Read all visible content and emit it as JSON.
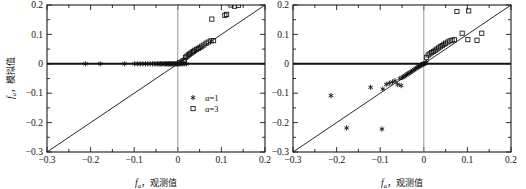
{
  "figure": {
    "panel_count": 2,
    "axis_x_title_sym": "f",
    "axis_x_title_subscript": "a",
    "axis_x_title_cjk": "，观测值",
    "axis_y_title_sym": "f",
    "axis_y_title_subscript": "a",
    "axis_y_title_cjk": "，模拟值",
    "tick_labels_x": [
      "-0.3",
      "-0.2",
      "-0.1",
      "0",
      "0.1",
      "0.2"
    ],
    "tick_labels_y": [
      "-0.3",
      "-0.2",
      "-0.1",
      "0",
      "0.1",
      "0.2"
    ],
    "legend": {
      "entries": [
        {
          "label": "α=1",
          "marker": "asterisk-marker"
        },
        {
          "label": "α=3",
          "marker": "open-square-marker"
        }
      ]
    },
    "colors": {
      "ink": "#111111",
      "frame": "#1a1a1a",
      "zero_line": "#111111",
      "vertical_zero": "#8a8a8a",
      "background": "#ffffff"
    }
  },
  "chart_data": [
    {
      "type": "scatter",
      "panel": "left",
      "title": "",
      "xlabel": "f_a，观测值",
      "ylabel": "f_a，模拟值",
      "xlim": [
        -0.3,
        0.2
      ],
      "ylim": [
        -0.3,
        0.2
      ],
      "xticks": [
        -0.3,
        -0.2,
        -0.1,
        0,
        0.1,
        0.2
      ],
      "yticks": [
        -0.3,
        -0.2,
        -0.1,
        0,
        0.1,
        0.2
      ],
      "grid": false,
      "legend_position": "lower-right-inside",
      "reference_lines": [
        {
          "name": "one-to-one-line",
          "type": "diagonal",
          "from": [
            -0.3,
            -0.3
          ],
          "to": [
            0.2,
            0.2
          ]
        },
        {
          "name": "horizontal-zero-line",
          "type": "horizontal",
          "y": 0
        },
        {
          "name": "vertical-zero-line",
          "type": "vertical",
          "x": 0
        }
      ],
      "series": [
        {
          "name": "α=1",
          "marker": "asterisk",
          "points": [
            [
              -0.212,
              0.0
            ],
            [
              -0.178,
              0.0
            ],
            [
              -0.122,
              0.0
            ],
            [
              -0.099,
              0.0
            ],
            [
              -0.092,
              0.0
            ],
            [
              -0.086,
              0.0
            ],
            [
              -0.08,
              0.0
            ],
            [
              -0.074,
              0.0
            ],
            [
              -0.069,
              0.0
            ],
            [
              -0.063,
              0.0
            ],
            [
              -0.058,
              0.0
            ],
            [
              -0.054,
              0.0
            ],
            [
              -0.05,
              0.0
            ],
            [
              -0.046,
              0.0
            ],
            [
              -0.043,
              0.0
            ],
            [
              -0.04,
              0.0
            ],
            [
              -0.037,
              0.0
            ],
            [
              -0.034,
              0.0
            ],
            [
              -0.031,
              0.0
            ],
            [
              -0.028,
              0.0
            ],
            [
              -0.026,
              0.0
            ],
            [
              -0.023,
              0.0
            ],
            [
              -0.021,
              0.0
            ],
            [
              -0.019,
              0.0
            ],
            [
              -0.017,
              0.0
            ],
            [
              -0.015,
              0.0
            ],
            [
              -0.013,
              0.0
            ],
            [
              -0.011,
              0.0
            ],
            [
              -0.009,
              0.0
            ],
            [
              -0.007,
              0.0
            ],
            [
              -0.005,
              0.0
            ],
            [
              -0.003,
              0.0
            ],
            [
              -0.001,
              0.0
            ],
            [
              0.001,
              0.0
            ],
            [
              0.003,
              0.0
            ],
            [
              0.006,
              0.0
            ],
            [
              0.009,
              0.0
            ],
            [
              0.012,
              0.0
            ],
            [
              0.016,
              0.0
            ],
            [
              0.02,
              0.0
            ]
          ]
        },
        {
          "name": "α=3",
          "marker": "open-square",
          "points": [
            [
              0.004,
              0.004
            ],
            [
              0.008,
              0.006
            ],
            [
              0.012,
              0.01
            ],
            [
              0.015,
              0.012
            ],
            [
              0.018,
              0.022
            ],
            [
              0.021,
              0.026
            ],
            [
              0.024,
              0.03
            ],
            [
              0.027,
              0.033
            ],
            [
              0.03,
              0.036
            ],
            [
              0.033,
              0.04
            ],
            [
              0.036,
              0.042
            ],
            [
              0.039,
              0.046
            ],
            [
              0.043,
              0.049
            ],
            [
              0.047,
              0.052
            ],
            [
              0.051,
              0.056
            ],
            [
              0.055,
              0.06
            ],
            [
              0.06,
              0.064
            ],
            [
              0.065,
              0.07
            ],
            [
              0.07,
              0.074
            ],
            [
              0.076,
              0.078
            ],
            [
              0.082,
              0.079
            ],
            [
              0.078,
              0.152
            ],
            [
              0.108,
              0.165
            ],
            [
              0.112,
              0.168
            ],
            [
              0.13,
              0.196
            ],
            [
              0.139,
              0.199
            ],
            [
              0.122,
              0.2
            ]
          ]
        }
      ]
    },
    {
      "type": "scatter",
      "panel": "right",
      "title": "",
      "xlabel": "f_a，观测值",
      "ylabel": "f_a，模拟值",
      "xlim": [
        -0.3,
        0.2
      ],
      "ylim": [
        -0.3,
        0.2
      ],
      "xticks": [
        -0.3,
        -0.2,
        -0.1,
        0,
        0.1,
        0.2
      ],
      "yticks": [
        -0.3,
        -0.2,
        -0.1,
        0,
        0.1,
        0.2
      ],
      "grid": false,
      "legend_position": "none",
      "reference_lines": [
        {
          "name": "one-to-one-line",
          "type": "diagonal",
          "from": [
            -0.3,
            -0.3
          ],
          "to": [
            0.2,
            0.2
          ]
        },
        {
          "name": "horizontal-zero-line",
          "type": "horizontal",
          "y": 0
        },
        {
          "name": "vertical-zero-line",
          "type": "vertical",
          "x": 0
        }
      ],
      "series": [
        {
          "name": "α=1",
          "marker": "asterisk",
          "points": [
            [
              -0.213,
              -0.108
            ],
            [
              -0.177,
              -0.218
            ],
            [
              -0.122,
              -0.08
            ],
            [
              -0.096,
              -0.222
            ],
            [
              -0.094,
              -0.086
            ],
            [
              -0.086,
              -0.07
            ],
            [
              -0.079,
              -0.066
            ],
            [
              -0.072,
              -0.062
            ],
            [
              -0.066,
              -0.058
            ],
            [
              -0.06,
              -0.07
            ],
            [
              -0.055,
              -0.05
            ],
            [
              -0.052,
              -0.074
            ],
            [
              -0.049,
              -0.046
            ],
            [
              -0.046,
              -0.044
            ],
            [
              -0.043,
              -0.04
            ],
            [
              -0.04,
              -0.038
            ],
            [
              -0.037,
              -0.034
            ],
            [
              -0.034,
              -0.032
            ],
            [
              -0.031,
              -0.029
            ],
            [
              -0.028,
              -0.026
            ],
            [
              -0.025,
              -0.023
            ],
            [
              -0.022,
              -0.02
            ],
            [
              -0.019,
              -0.017
            ],
            [
              -0.016,
              -0.014
            ],
            [
              -0.013,
              -0.011
            ],
            [
              -0.011,
              -0.009
            ],
            [
              -0.009,
              -0.007
            ],
            [
              -0.007,
              -0.005
            ],
            [
              -0.005,
              -0.004
            ],
            [
              -0.003,
              -0.002
            ],
            [
              -0.002,
              -0.001
            ],
            [
              0.0,
              0.0
            ],
            [
              0.002,
              0.001
            ],
            [
              0.004,
              0.003
            ],
            [
              0.006,
              0.004
            ]
          ]
        },
        {
          "name": "α=3",
          "marker": "open-square",
          "points": [
            [
              0.006,
              0.022
            ],
            [
              0.01,
              0.03
            ],
            [
              0.014,
              0.034
            ],
            [
              0.018,
              0.038
            ],
            [
              0.022,
              0.042
            ],
            [
              0.026,
              0.046
            ],
            [
              0.03,
              0.05
            ],
            [
              0.034,
              0.054
            ],
            [
              0.038,
              0.058
            ],
            [
              0.042,
              0.062
            ],
            [
              0.046,
              0.066
            ],
            [
              0.05,
              0.07
            ],
            [
              0.055,
              0.074
            ],
            [
              0.06,
              0.078
            ],
            [
              0.065,
              0.08
            ],
            [
              0.07,
              0.082
            ],
            [
              0.076,
              0.178
            ],
            [
              0.103,
              0.18
            ],
            [
              0.101,
              0.082
            ],
            [
              0.122,
              0.08
            ],
            [
              0.133,
              0.104
            ],
            [
              0.088,
              0.104
            ]
          ]
        }
      ]
    }
  ]
}
